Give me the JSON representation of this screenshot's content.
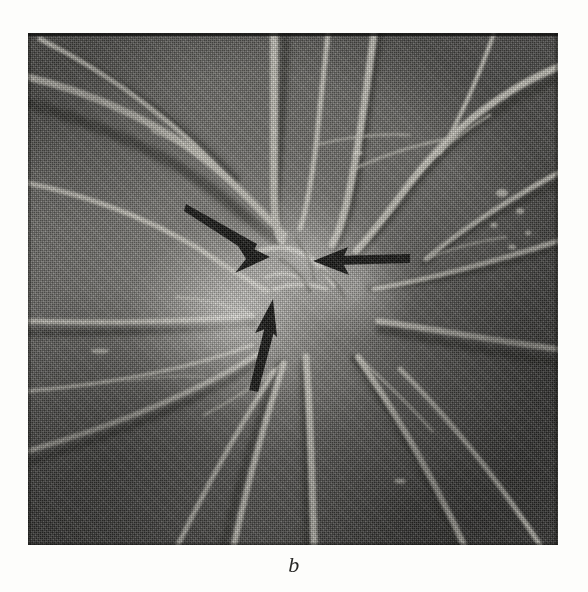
{
  "figure": {
    "caption_label": "b",
    "kind": "halftone-photograph"
  },
  "photo": {
    "frame": {
      "x": 28,
      "y": 33,
      "width": 530,
      "height": 512
    },
    "palette": {
      "page_background": "#fdfdfb",
      "photo_mid_tone": "#74736f",
      "photo_dark_tone": "#4e4d4a",
      "photo_highlight": "#e8e6de",
      "plate_edge_ink": "#10100e",
      "arrow_ink": "#141412",
      "caption_ink": "#2a2a28"
    },
    "features": [
      {
        "name": "optic-disc-halo",
        "cx_pct": 39,
        "cy_pct": 55
      },
      {
        "name": "vessel-convergence",
        "cx_pct": 52,
        "cy_pct": 46
      },
      {
        "name": "bright-exudate-specks",
        "cx_pct": 91,
        "cy_pct": 33
      }
    ]
  },
  "annotations": {
    "arrow_color": "#141412",
    "arrows": [
      {
        "id": "arrow-upper-left",
        "label": "upper-left arrow pointing down-right",
        "tail": {
          "x": 186,
          "y": 207
        },
        "tip": {
          "x": 268,
          "y": 256
        }
      },
      {
        "id": "arrow-right",
        "label": "right arrow pointing left",
        "tail": {
          "x": 410,
          "y": 257
        },
        "tip": {
          "x": 314,
          "y": 261
        }
      },
      {
        "id": "arrow-lower",
        "label": "lower arrow pointing up",
        "tail": {
          "x": 252,
          "y": 390
        },
        "tip": {
          "x": 272,
          "y": 300
        }
      }
    ]
  }
}
